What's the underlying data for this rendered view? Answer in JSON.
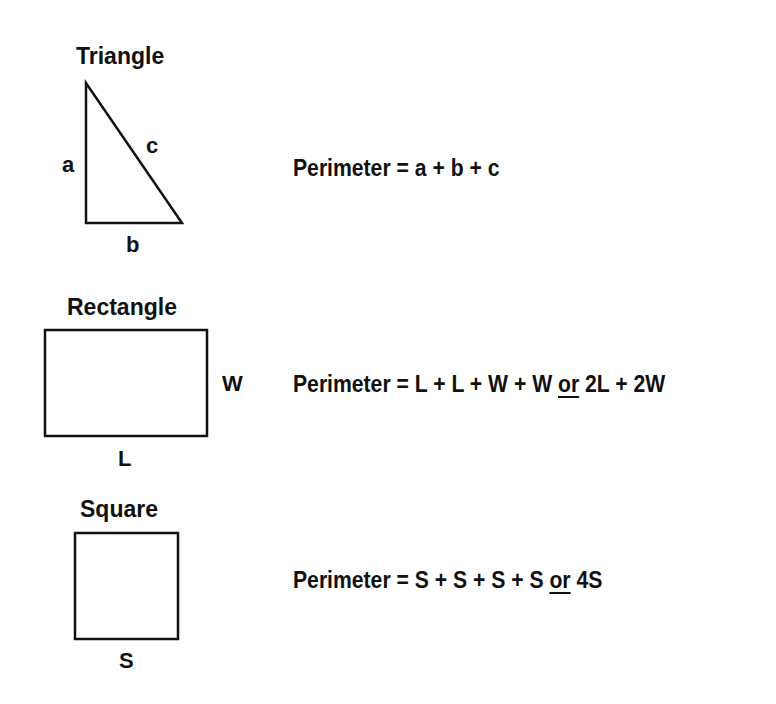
{
  "shapes": {
    "triangle": {
      "title": "Triangle",
      "side_labels": {
        "a": "a",
        "b": "b",
        "c": "c"
      },
      "formula": {
        "prefix": "Perimeter = a + b + c"
      }
    },
    "rectangle": {
      "title": "Rectangle",
      "side_labels": {
        "length": "L",
        "width": "W"
      },
      "formula": {
        "prefix": "Perimeter = L + L + W + W ",
        "or": "or",
        "suffix": " 2L + 2W"
      }
    },
    "square": {
      "title": "Square",
      "side_labels": {
        "side": "S"
      },
      "formula": {
        "prefix": "Perimeter = S + S + S + S ",
        "or": "or",
        "suffix": " 4S"
      }
    }
  },
  "colors": {
    "stroke": "#111111",
    "background": "#ffffff"
  }
}
